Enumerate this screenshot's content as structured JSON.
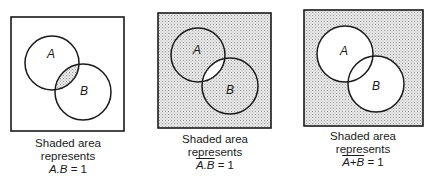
{
  "diagrams": [
    {
      "id": "and",
      "box": {
        "x": 11,
        "y": 17,
        "w": 113,
        "h": 114
      },
      "circle_a": {
        "cx": 52,
        "cy": 63,
        "r": 27,
        "label": "A"
      },
      "circle_b": {
        "cx": 83,
        "cy": 92,
        "r": 28,
        "label": "B"
      },
      "shading": "intersection",
      "caption": {
        "line1": "Shaded area",
        "line2": "represents",
        "expr_overlined": "",
        "expr_plain": "A.B",
        "equals": " = 1"
      }
    },
    {
      "id": "nand",
      "box": {
        "x": 158,
        "y": 13,
        "w": 113,
        "h": 115
      },
      "circle_a": {
        "cx": 198,
        "cy": 55,
        "r": 27,
        "label": "A"
      },
      "circle_b": {
        "cx": 230,
        "cy": 86,
        "r": 28,
        "label": "B"
      },
      "shading": "complement-of-intersection",
      "caption": {
        "line1": "Shaded area",
        "line2": "represents",
        "expr_overlined": "A.B",
        "expr_plain": "",
        "equals": " = 1"
      }
    },
    {
      "id": "nor",
      "box": {
        "x": 304,
        "y": 10,
        "w": 119,
        "h": 116
      },
      "circle_a": {
        "cx": 345,
        "cy": 54,
        "r": 28,
        "label": "A"
      },
      "circle_b": {
        "cx": 376,
        "cy": 84,
        "r": 28,
        "label": "B"
      },
      "shading": "complement-of-union",
      "caption": {
        "line1": "Shaded area",
        "line2": "represents",
        "expr_overlined": "A+B",
        "expr_plain": "",
        "equals": " = 1"
      }
    }
  ],
  "colors": {
    "stroke": "#1a1a1a",
    "shade_bg": "#e6e6e6",
    "shade_dot": "#9a9a9a",
    "background": "#ffffff"
  }
}
